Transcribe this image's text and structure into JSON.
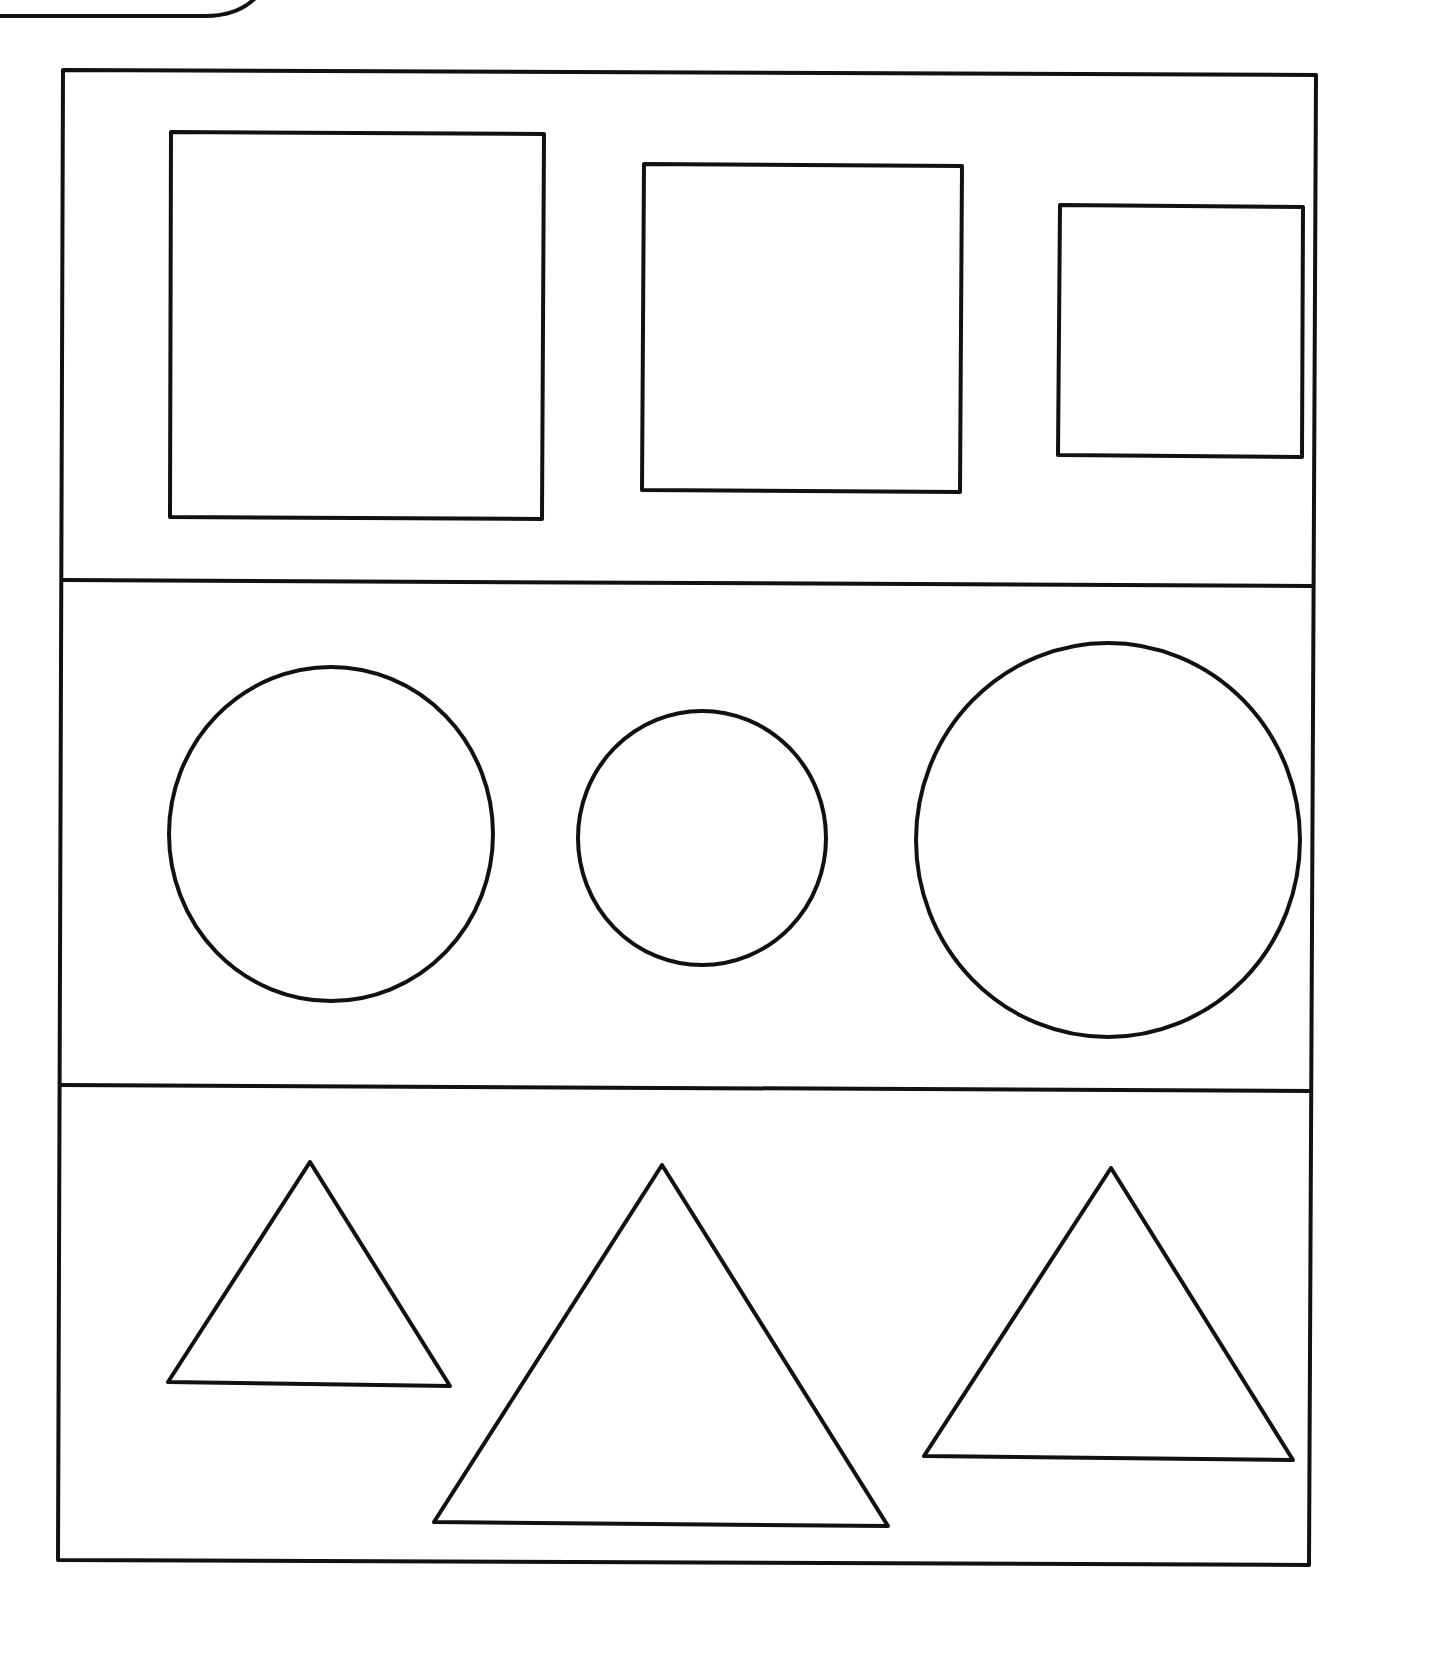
{
  "colors": {
    "background": "#ffffff",
    "stroke": "#111111"
  },
  "stroke_width": 4,
  "corner_tab": {
    "description": "rounded tab edge at top-left",
    "path": "M0,16 L205,16 Q240,16 258,-5"
  },
  "frame": {
    "outer": [
      [
        63,
        70
      ],
      [
        1316,
        75
      ],
      [
        1309,
        1565
      ],
      [
        58,
        1560
      ]
    ],
    "dividers": [
      {
        "from": [
          63,
          580
        ],
        "to": [
          1312,
          586
        ]
      },
      {
        "from": [
          61,
          1085
        ],
        "to": [
          1310,
          1091
        ]
      }
    ]
  },
  "rows": [
    {
      "name": "squares",
      "shapes": [
        {
          "type": "rect",
          "points": [
            [
              171,
              132
            ],
            [
              544,
              134
            ],
            [
              542,
              519
            ],
            [
              170,
              517
            ]
          ]
        },
        {
          "type": "rect",
          "points": [
            [
              644,
              164
            ],
            [
              962,
              166
            ],
            [
              960,
              492
            ],
            [
              642,
              490
            ]
          ]
        },
        {
          "type": "rect",
          "points": [
            [
              1060,
              205
            ],
            [
              1303,
              207
            ],
            [
              1302,
              457
            ],
            [
              1058,
              455
            ]
          ]
        }
      ]
    },
    {
      "name": "circles",
      "shapes": [
        {
          "type": "ellipse",
          "cx": 331,
          "cy": 834,
          "rx": 162,
          "ry": 167
        },
        {
          "type": "ellipse",
          "cx": 702,
          "cy": 838,
          "rx": 124,
          "ry": 127
        },
        {
          "type": "ellipse",
          "cx": 1108,
          "cy": 840,
          "rx": 192,
          "ry": 197
        }
      ]
    },
    {
      "name": "triangles",
      "shapes": [
        {
          "type": "triangle",
          "points": [
            [
              310,
              1162
            ],
            [
              168,
              1382
            ],
            [
              450,
              1386
            ]
          ]
        },
        {
          "type": "triangle",
          "points": [
            [
              662,
              1165
            ],
            [
              434,
              1522
            ],
            [
              888,
              1526
            ]
          ]
        },
        {
          "type": "triangle",
          "points": [
            [
              1111,
              1168
            ],
            [
              924,
              1456
            ],
            [
              1293,
              1460
            ]
          ]
        }
      ]
    }
  ]
}
